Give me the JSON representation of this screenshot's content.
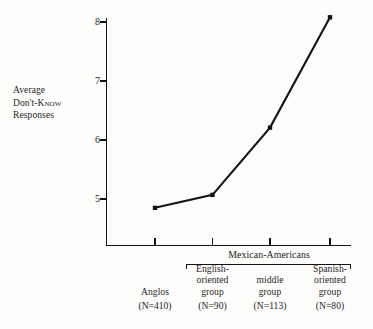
{
  "chart_data": {
    "type": "line",
    "title": "",
    "xlabel": "",
    "ylabel": "Average Don't-Know Responses",
    "ylim": [
      4.55,
      8.35
    ],
    "yticks": [
      5,
      6,
      7,
      8
    ],
    "ytick_labels": [
      "5",
      "6",
      "7",
      "8"
    ],
    "grid": false,
    "legend": "none",
    "categories": [
      "Anglos",
      "English-oriented group",
      "middle group",
      "Spanish-oriented group"
    ],
    "values": [
      4.85,
      5.07,
      6.21,
      8.08
    ],
    "point_marker": "filled-square",
    "annotations": [
      {
        "text": "Mexican-Americans",
        "spans_categories": [
          "English-oriented group",
          "middle group",
          "Spanish-oriented group"
        ]
      }
    ]
  },
  "axis": {
    "y_title_lines": [
      "Average",
      "Don't-",
      "Know",
      "Responses"
    ],
    "y_title_line1": "Average",
    "y_title_line2_a": "Don't-",
    "y_title_line2_b": "Know",
    "y_title_line3": "Responses",
    "y_ticks": [
      {
        "label": "8",
        "value": 8
      },
      {
        "label": "7",
        "value": 7
      },
      {
        "label": "6",
        "value": 6
      },
      {
        "label": "5",
        "value": 5
      }
    ]
  },
  "group_bracket": {
    "label": "Mexican-Americans"
  },
  "categories": [
    {
      "key": "anglos",
      "name": "Anglos",
      "n_label": "(N=410)",
      "n": 410,
      "value": 4.85
    },
    {
      "key": "english-oriented",
      "name": "English-\noriented\ngroup",
      "n_label": "(N=90)",
      "n": 90,
      "value": 5.07
    },
    {
      "key": "middle",
      "name": "middle\ngroup",
      "n_label": "(N=113)",
      "n": 113,
      "value": 6.21
    },
    {
      "key": "spanish-oriented",
      "name": "Spanish-\noriented\ngroup",
      "n_label": "(N=80)",
      "n": 80,
      "value": 8.08
    }
  ],
  "colors": {
    "ink": "#141414",
    "paper": "#fdfdfb"
  }
}
